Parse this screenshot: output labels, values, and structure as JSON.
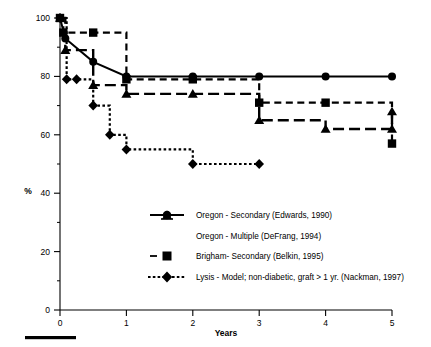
{
  "chart_data": {
    "type": "line",
    "title": "",
    "subtitle": "",
    "xlabel": "Years",
    "ylabel": "%",
    "xlim": [
      0,
      5
    ],
    "ylim": [
      0,
      100
    ],
    "xticks": [
      0,
      1,
      2,
      3,
      4,
      5
    ],
    "xtick_labels": [
      "0",
      "1",
      "2",
      "3",
      "4",
      "5"
    ],
    "yticks": [
      0,
      20,
      40,
      60,
      80,
      100
    ],
    "ytick_labels": [
      "0",
      "20",
      "40",
      "60",
      "80",
      "100"
    ],
    "yticks_minor": [
      10,
      30,
      50,
      70,
      90
    ],
    "grid": false,
    "legend_position": "lower-center-right",
    "step_style": "post",
    "series": [
      {
        "name": "Oregon - Secondary (Edwards, 1990)",
        "marker": "circle",
        "line_style": "solid",
        "x": [
          0,
          0.08,
          0.5,
          1,
          2,
          3,
          4,
          5
        ],
        "y": [
          100,
          93,
          85,
          80,
          80,
          80,
          80,
          80
        ]
      },
      {
        "name": "Oregon - Multiple (DeFrang, 1994)",
        "marker": "triangle",
        "line_style": "long-dash",
        "x": [
          0,
          0.08,
          0.5,
          1,
          2,
          3,
          4,
          5,
          5
        ],
        "y": [
          100,
          89,
          77,
          74,
          74,
          65,
          62,
          62,
          68
        ]
      },
      {
        "name": "Brigham - Secondary (Belkin, 1995)",
        "marker": "square",
        "line_style": "dash",
        "x": [
          0,
          0.05,
          0.5,
          1,
          2,
          3,
          4,
          5
        ],
        "y": [
          100,
          95,
          95,
          79,
          79,
          71,
          71,
          57
        ]
      },
      {
        "name": "Lysis - Model; non-diabetic, graft > 1 yr. (Nackman, 1997)",
        "marker": "diamond",
        "line_style": "dotted",
        "x": [
          0,
          0.1,
          0.25,
          0.5,
          0.75,
          1,
          2,
          3
        ],
        "y": [
          100,
          79,
          79,
          70,
          60,
          55,
          50,
          50
        ]
      }
    ]
  },
  "axes": {
    "y_axis_title": "%",
    "x_axis_title": "Years",
    "y_tick_labels": [
      "100",
      "80",
      "60",
      "40",
      "20",
      "0"
    ],
    "x_tick_labels": [
      "0",
      "1",
      "2",
      "3",
      "4",
      "5"
    ]
  },
  "legend": {
    "entries": [
      {
        "label": "Oregon - Secondary (Edwards, 1990)",
        "marker": "circle-icon",
        "line": "solid"
      },
      {
        "label": "Oregon - Multiple (DeFrang, 1994)",
        "marker": "triangle-icon",
        "line": "none"
      },
      {
        "label": "Brigham- Secondary (Belkin, 1995)",
        "marker": "square-icon",
        "line": "dash"
      },
      {
        "label": "Lysis - Model; non-diabetic, graft > 1 yr. (Nackman, 1997)",
        "marker": "diamond-icon",
        "line": "dotted"
      }
    ]
  },
  "colors": {
    "ink": "#000000",
    "background": "#ffffff",
    "axis": "#000000"
  },
  "footer": {
    "scale_bar": ""
  }
}
